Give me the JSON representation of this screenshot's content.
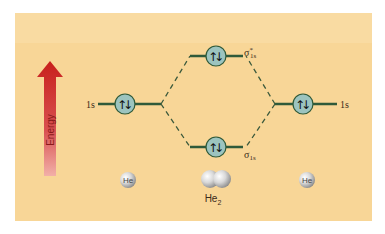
{
  "diagram": {
    "type": "molecular-orbital-energy-diagram",
    "molecule": "He2",
    "energy_axis_label": "Energy",
    "left_atom": {
      "symbol": "He",
      "orbital_label": "1s",
      "electrons": "up-down"
    },
    "right_atom": {
      "symbol": "He",
      "orbital_label": "1s",
      "electrons": "up-down"
    },
    "molecular_orbitals": [
      {
        "name": "antibonding",
        "label_base": "σ",
        "label_sup": "*",
        "label_sub": "1s",
        "electrons": "up-down"
      },
      {
        "name": "bonding",
        "label_base": "σ",
        "label_sub": "1s",
        "electrons": "up-down"
      }
    ],
    "molecule_label_base": "He",
    "molecule_label_sub": "2",
    "colors": {
      "background": "#f8d697",
      "level_line": "#2f5a3a",
      "orbital_fill": "#9cc4bf",
      "arrow_top": "#c8201c",
      "arrow_bottom": "#f0a0a0",
      "dashed_line": "#3c5a3c"
    }
  }
}
